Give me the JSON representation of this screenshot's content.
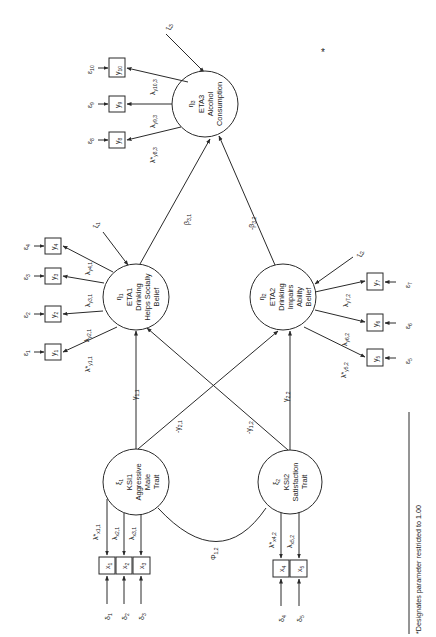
{
  "figure": {
    "orientation": "rotated-90-ccw",
    "footnote": "*Designates parameter restricted to 1.00",
    "asterisk_mark": "*"
  },
  "latent_exogenous": [
    {
      "id": "xi1",
      "symbol": "ξ",
      "sub": "1",
      "name": "KSI1",
      "line1": "Aggressive",
      "line2": "Male",
      "line3": "Trait"
    },
    {
      "id": "xi2",
      "symbol": "ξ",
      "sub": "2",
      "name": "KSI2",
      "line1": "Satisfaction",
      "line2": "Trait",
      "line3": ""
    }
  ],
  "latent_endogenous": [
    {
      "id": "eta1",
      "symbol": "η",
      "sub": "1",
      "name": "ETA1",
      "line1": "Drinking",
      "line2": "Helps Socially",
      "line3": "Belief"
    },
    {
      "id": "eta2",
      "symbol": "η",
      "sub": "2",
      "name": "ETA2",
      "line1": "Drinking",
      "line2": "Impairs",
      "line3": "Ability",
      "line4": "Belief"
    },
    {
      "id": "eta3",
      "symbol": "η",
      "sub": "3",
      "name": "ETA3",
      "line1": "Alcohol",
      "line2": "Consumption",
      "line3": ""
    }
  ],
  "disturbances": [
    {
      "symbol": "ζ",
      "sub": "1"
    },
    {
      "symbol": "ζ",
      "sub": "2"
    },
    {
      "symbol": "ζ",
      "sub": "3"
    }
  ],
  "indicators_y": [
    {
      "label": "y",
      "sub": "1",
      "err": "ε",
      "err_sub": "1",
      "loading": "λ*",
      "loading_sub": "y1,1"
    },
    {
      "label": "y",
      "sub": "2",
      "err": "ε",
      "err_sub": "2",
      "loading": "λ",
      "loading_sub": "y2,1"
    },
    {
      "label": "y",
      "sub": "3",
      "err": "ε",
      "err_sub": "3",
      "loading": "λ",
      "loading_sub": "y3,1"
    },
    {
      "label": "y",
      "sub": "4",
      "err": "ε",
      "err_sub": "4",
      "loading": "λ",
      "loading_sub": "y4,1"
    },
    {
      "label": "y",
      "sub": "5",
      "err": "ε",
      "err_sub": "5",
      "loading": "λ*",
      "loading_sub": "y5,2"
    },
    {
      "label": "y",
      "sub": "6",
      "err": "ε",
      "err_sub": "6",
      "loading": "λ",
      "loading_sub": "y6,2"
    },
    {
      "label": "y",
      "sub": "7",
      "err": "ε",
      "err_sub": "7",
      "loading": "λ",
      "loading_sub": "y7,2"
    },
    {
      "label": "y",
      "sub": "8",
      "err": "ε",
      "err_sub": "8",
      "loading": "λ*",
      "loading_sub": "y8,3"
    },
    {
      "label": "y",
      "sub": "9",
      "err": "ε",
      "err_sub": "9",
      "loading": "λ",
      "loading_sub": "y9,3"
    },
    {
      "label": "y",
      "sub": "10",
      "err": "ε",
      "err_sub": "10",
      "loading": "λ",
      "loading_sub": "y10,3"
    }
  ],
  "indicators_x": [
    {
      "label": "x",
      "sub": "1",
      "err": "δ",
      "err_sub": "1",
      "loading": "λ*",
      "loading_sub": "x1,1"
    },
    {
      "label": "x",
      "sub": "2",
      "err": "δ",
      "err_sub": "2",
      "loading": "λ",
      "loading_sub": "x2,1"
    },
    {
      "label": "x",
      "sub": "3",
      "err": "δ",
      "err_sub": "3",
      "loading": "λ",
      "loading_sub": "x3,1"
    },
    {
      "label": "x",
      "sub": "4",
      "err": "δ",
      "err_sub": "4",
      "loading": "λ*",
      "loading_sub": "x4,2"
    },
    {
      "label": "x",
      "sub": "5",
      "err": "δ",
      "err_sub": "5",
      "loading": "λ",
      "loading_sub": "x5,2"
    }
  ],
  "paths": [
    {
      "from": "xi1",
      "to": "eta1",
      "symbol": "γ",
      "sub": "1,1",
      "sign": ""
    },
    {
      "from": "xi1",
      "to": "eta2",
      "symbol": "γ",
      "sub": "2,1",
      "sign": "-"
    },
    {
      "from": "xi2",
      "to": "eta1",
      "symbol": "γ",
      "sub": "1,2",
      "sign": "-"
    },
    {
      "from": "xi2",
      "to": "eta2",
      "symbol": "γ",
      "sub": "2,2",
      "sign": ""
    },
    {
      "from": "eta1",
      "to": "eta3",
      "symbol": "β",
      "sub": "3,1",
      "sign": ""
    },
    {
      "from": "eta2",
      "to": "eta3",
      "symbol": "β",
      "sub": "3,2",
      "sign": "-"
    }
  ],
  "covariance": {
    "symbol": "Φ",
    "sub": "1,2"
  }
}
